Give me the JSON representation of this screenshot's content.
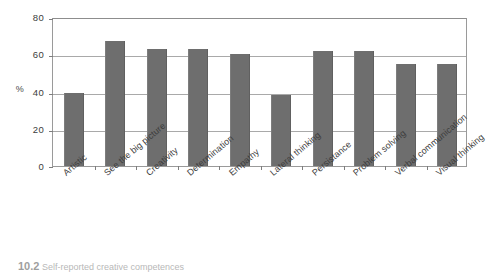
{
  "chart_data": {
    "type": "bar",
    "title": "",
    "xlabel": "",
    "ylabel": "%",
    "ylim": [
      0,
      80
    ],
    "yticks": [
      0,
      20,
      40,
      60,
      80
    ],
    "grid": true,
    "legend": "none",
    "categories": [
      "Artistic",
      "See the big picture",
      "Creativity",
      "Determination",
      "Empathy",
      "Lateral thinking",
      "Persistance",
      "Problem solving",
      "Verbal communication",
      "Visual thinking"
    ],
    "values": [
      39,
      67,
      63,
      63,
      60,
      38,
      62,
      62,
      55,
      55
    ],
    "bar_color": "#6e6e6e",
    "frame_color": "#9a9a9a",
    "gridline_color": "#a9a9a9"
  },
  "caption": {
    "number": "10.2",
    "text": "Self-reported creative competences"
  }
}
